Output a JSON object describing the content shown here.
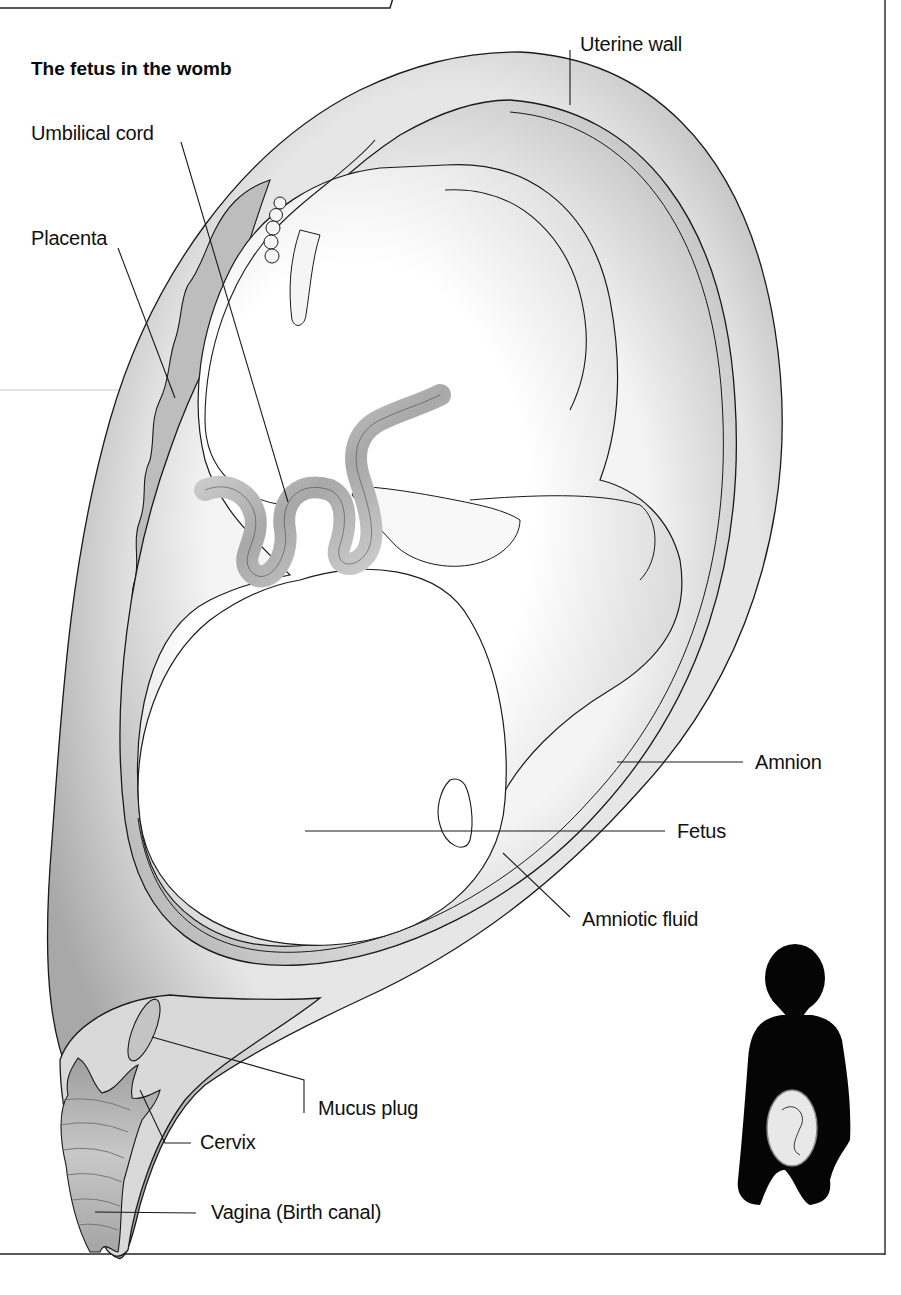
{
  "title": "The fetus in the womb",
  "labels": {
    "uterine_wall": "Uterine wall",
    "umbilical_cord": "Umbilical cord",
    "placenta": "Placenta",
    "amnion": "Amnion",
    "fetus": "Fetus",
    "amniotic_fluid": "Amniotic fluid",
    "mucus_plug": "Mucus plug",
    "cervix": "Cervix",
    "vagina": "Vagina (Birth canal)"
  },
  "inset": {
    "description": "Silhouette of pregnant woman showing fetus position"
  },
  "colors": {
    "line": "#1a1a1a",
    "uterine_wall": "#b8b8b8",
    "amniotic_fluid": "#d2d2d2",
    "fetus_skin": "#f7f7f7",
    "placenta": "#9a9a9a",
    "silhouette": "#050505"
  }
}
